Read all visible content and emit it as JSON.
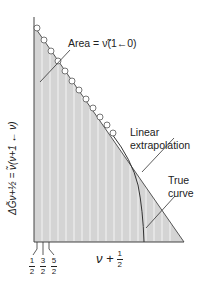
{
  "diagram": {
    "annotations": {
      "area": "Area = ν̃(1←0)",
      "linear_1": "Linear",
      "linear_2": "extrapolation",
      "true_1": "True",
      "true_2": "curve"
    },
    "y_axis_label": "ΔG̃ν+½ = ν̃(ν+1 ← ν)",
    "x_axis_label": {
      "main": "ν +",
      "frac_num": "1",
      "frac_den": "2"
    },
    "x_ticks": [
      {
        "num": "1",
        "den": "2"
      },
      {
        "num": "3",
        "den": "2"
      },
      {
        "num": "5",
        "den": "2"
      }
    ],
    "colors": {
      "fill": "#d4d4d4",
      "stripe": "#f2f2f2",
      "line": "#333333"
    }
  }
}
